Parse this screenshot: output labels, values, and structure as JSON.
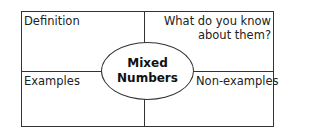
{
  "diagram": {
    "type": "frayer-model",
    "center": {
      "line1": "Mixed",
      "line2": "Numbers"
    },
    "quadrants": {
      "top_left": "Definition",
      "top_right_line1": "What do you know",
      "top_right_line2": "about them?",
      "bottom_left": "Examples",
      "bottom_right": "Non-examples"
    },
    "colors": {
      "line": "#333333",
      "background": "#ffffff",
      "text": "#222222"
    }
  }
}
